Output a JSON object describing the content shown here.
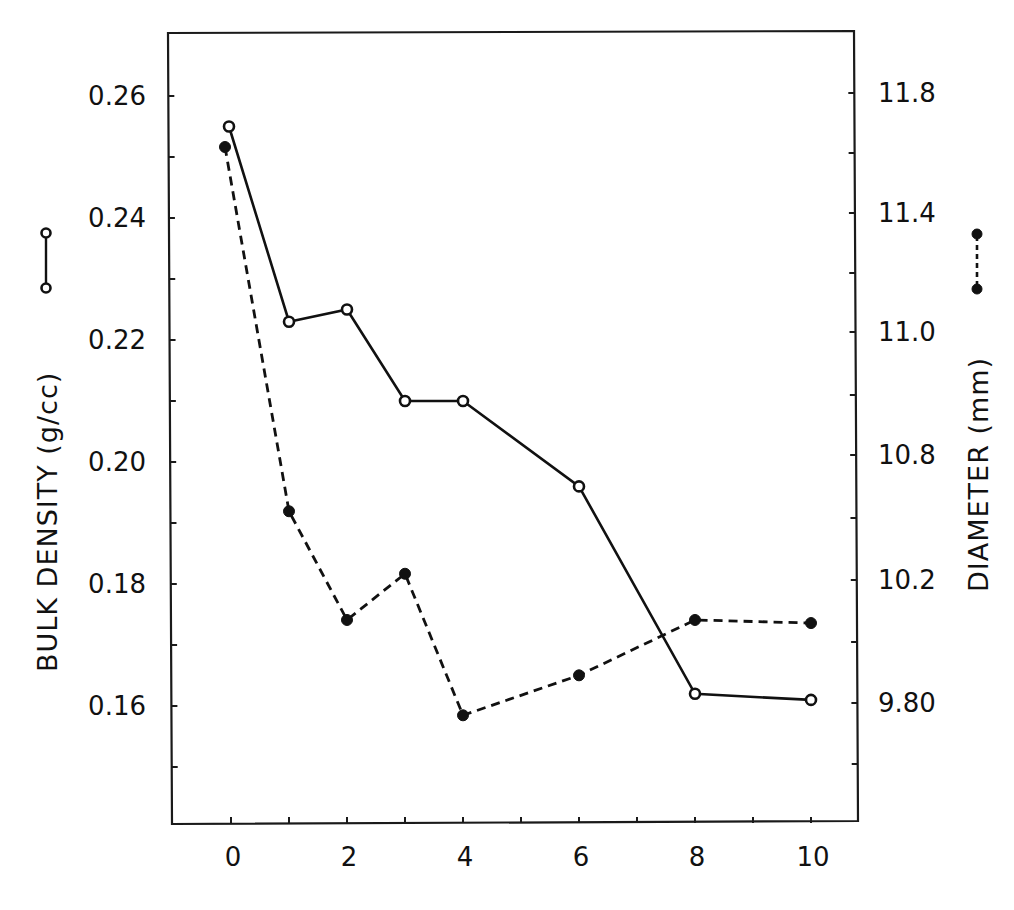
{
  "chart_data": {
    "type": "line",
    "title": "",
    "xlabel": "",
    "x_ticks": [
      0,
      2,
      4,
      6,
      8,
      10
    ],
    "x_minor_ticks": [
      0,
      1,
      2,
      3,
      4,
      5,
      6,
      7,
      8,
      9,
      10
    ],
    "xlim": [
      -1.1,
      10.8
    ],
    "y_left": {
      "label": "BULK DENSITY (g/cc)",
      "ticks": [
        "0.26",
        "0.24",
        "0.22",
        "0.20",
        "0.18",
        "0.16"
      ],
      "ylim": [
        0.145,
        0.272
      ]
    },
    "y_right": {
      "label": "DIAMETER (mm)",
      "ticks": [
        "11.8",
        "11.4",
        "11.0",
        "10.8",
        "10.2",
        "9.80"
      ],
      "note": "tick labels as printed (non-uniform spacing in label values)"
    },
    "series": [
      {
        "name": "Bulk density",
        "axis": "left",
        "style": "solid line, open circles",
        "x": [
          0,
          1,
          2,
          3,
          4,
          6,
          8,
          10
        ],
        "values": [
          0.255,
          0.223,
          0.225,
          0.21,
          0.21,
          0.196,
          0.162,
          0.161
        ]
      },
      {
        "name": "Diameter",
        "axis": "right",
        "style": "dashed line, filled circles",
        "x": [
          0,
          1,
          2,
          3,
          4,
          6,
          8,
          10
        ],
        "values": [
          11.62,
          10.53,
          10.07,
          10.23,
          9.76,
          9.89,
          10.07,
          10.06
        ]
      }
    ],
    "legend": [
      {
        "label": "open circle, solid line",
        "series": "Bulk density",
        "position": "left axis title"
      },
      {
        "label": "filled circle, dashed line",
        "series": "Diameter",
        "position": "right axis title"
      }
    ],
    "grid": false
  },
  "axes": {
    "left_title": "BULK DENSITY (g/cc)",
    "right_title": "DIAMETER (mm)",
    "x_tick_labels": [
      "0",
      "2",
      "4",
      "6",
      "8",
      "10"
    ],
    "left_tick_labels": [
      "0.26",
      "0.24",
      "0.22",
      "0.20",
      "0.18",
      "0.16"
    ],
    "right_tick_labels": [
      "11.8",
      "11.4",
      "11.0",
      "10.8",
      "10.2",
      "9.80"
    ]
  },
  "colors": {
    "ink": "#111111",
    "background": "#ffffff"
  }
}
